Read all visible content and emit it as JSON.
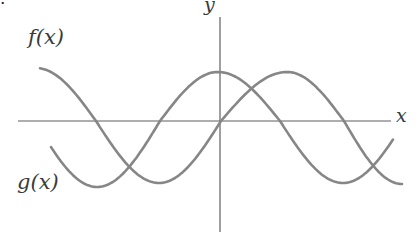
{
  "figure": {
    "corner_mark": ".",
    "background": "#ffffff"
  },
  "chart_data": {
    "type": "line",
    "title": "",
    "axes": {
      "x_label": "x",
      "y_label": "y",
      "grid": false,
      "ticks": "none",
      "x_axis_px": {
        "y": 121,
        "x_start": 18,
        "x_end": 391
      },
      "y_axis_px": {
        "x": 220,
        "y_start": 17,
        "y_end": 232
      }
    },
    "style": {
      "curve_color": "#868686",
      "axis_color": "#5f5f5f",
      "label_color": "#3a3a3a",
      "curve_width": 2.6,
      "axis_width": 1.2
    },
    "legend": {
      "position": "on-curve labels",
      "entries": [
        "f(x)",
        "g(x)"
      ]
    },
    "series": [
      {
        "name": "f",
        "label": "f(x)",
        "shape": "sine-like: zero at origin rising, max right of y-axis",
        "keypoints_px": [
          {
            "x": 36,
            "y": 68,
            "kind": "ext"
          },
          {
            "x": 96,
            "y": 121,
            "kind": "cross"
          },
          {
            "x": 159,
            "y": 183,
            "kind": "ext"
          },
          {
            "x": 221,
            "y": 121,
            "kind": "cross"
          },
          {
            "x": 287,
            "y": 72,
            "kind": "ext"
          },
          {
            "x": 344,
            "y": 121,
            "kind": "cross"
          },
          {
            "x": 402,
            "y": 184,
            "kind": "ext"
          }
        ],
        "clip_x": [
          40,
          402
        ]
      },
      {
        "name": "g",
        "label": "g(x)",
        "shape": "cosine-like: maximum at the y-axis",
        "keypoints_px": [
          {
            "x": 35,
            "y": 121,
            "kind": "cross"
          },
          {
            "x": 97,
            "y": 187,
            "kind": "ext"
          },
          {
            "x": 160,
            "y": 121,
            "kind": "cross"
          },
          {
            "x": 218,
            "y": 72,
            "kind": "ext"
          },
          {
            "x": 280,
            "y": 121,
            "kind": "cross"
          },
          {
            "x": 343,
            "y": 183,
            "kind": "ext"
          },
          {
            "x": 405,
            "y": 121,
            "kind": "cross"
          }
        ],
        "clip_x": [
          50,
          393
        ]
      }
    ]
  }
}
